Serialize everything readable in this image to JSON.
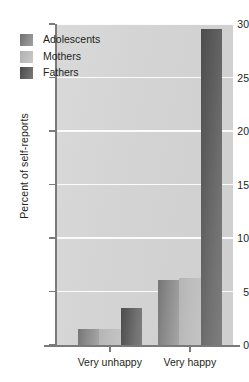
{
  "chart_data": {
    "type": "bar",
    "title": "",
    "subtitle": "",
    "xlabel": "",
    "ylabel": "Percent of self-reports",
    "categories": [
      "Very unhappy",
      "Very happy"
    ],
    "series": [
      {
        "name": "Adolescents",
        "values": [
          1.5,
          6.1
        ],
        "color": "#8a8a8a"
      },
      {
        "name": "Mothers",
        "values": [
          1.5,
          6.3
        ],
        "color": "#bdbdbd"
      },
      {
        "name": "Fathers",
        "values": [
          3.5,
          29.5
        ],
        "color": "#5c5c5c"
      }
    ],
    "ylim": [
      0,
      30
    ],
    "yticks": [
      0,
      5,
      10,
      15,
      20,
      25,
      30
    ],
    "ytick_labels": [
      "0",
      "5",
      "10",
      "15",
      "20",
      "25",
      "30"
    ],
    "grid": true,
    "grid_color": "#fbfbfb",
    "legend_position": "upper-left",
    "plot_background": "#d4d4d4",
    "figure_background": "#ffffff"
  },
  "legend": {
    "entries": [
      {
        "label": "Adolescents",
        "swatch": "adolescents"
      },
      {
        "label": "Mothers",
        "swatch": "mothers"
      },
      {
        "label": "Fathers",
        "swatch": "fathers"
      }
    ]
  }
}
